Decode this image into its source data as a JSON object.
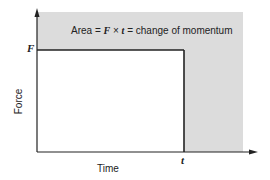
{
  "diagram": {
    "title_annotation": {
      "prefix": "Area =",
      "force_symbol": "F",
      "times": "×",
      "time_symbol": "t",
      "suffix": "= change of momentum"
    },
    "y_axis_label": "Force",
    "x_axis_label": "Time",
    "y_marker": "F",
    "x_marker": "t",
    "colors": {
      "shaded_region": "#dcdcdc",
      "lines": "#222222",
      "rectangle_fill": "#ffffff"
    }
  }
}
